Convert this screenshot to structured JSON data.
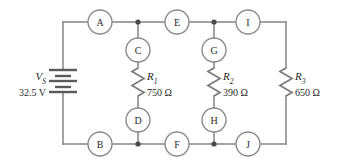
{
  "figure": {
    "type": "schematic-diagram",
    "line_color": "#8c8c8c",
    "text_color": "#1f1f1f"
  },
  "source": {
    "name": "voltage-source",
    "symbol": "V",
    "subscript": "S",
    "value": "32.5 V",
    "symbol_full": "VS"
  },
  "resistors": [
    {
      "symbol": "R",
      "subscript": "1",
      "value": "750 Ω",
      "name": "resistor-r1"
    },
    {
      "symbol": "R",
      "subscript": "2",
      "value": "390 Ω",
      "name": "resistor-r2"
    },
    {
      "symbol": "R",
      "subscript": "3",
      "value": "650 Ω",
      "name": "resistor-r3"
    }
  ],
  "nodes": [
    {
      "label": "A",
      "cx": 100,
      "cy": 22
    },
    {
      "label": "E",
      "cx": 177,
      "cy": 22
    },
    {
      "label": "I",
      "cx": 248,
      "cy": 22
    },
    {
      "label": "C",
      "cx": 138,
      "cy": 50
    },
    {
      "label": "G",
      "cx": 214,
      "cy": 50
    },
    {
      "label": "D",
      "cx": 138,
      "cy": 120
    },
    {
      "label": "H",
      "cx": 214,
      "cy": 120
    },
    {
      "label": "B",
      "cx": 100,
      "cy": 144
    },
    {
      "label": "F",
      "cx": 177,
      "cy": 144
    },
    {
      "label": "J",
      "cx": 248,
      "cy": 144
    }
  ],
  "junctions": [
    {
      "name": "junction-top-r1",
      "cx": 138,
      "cy": 22
    },
    {
      "name": "junction-top-r2",
      "cx": 214,
      "cy": 22
    },
    {
      "name": "junction-bottom-r1",
      "cx": 138,
      "cy": 144
    },
    {
      "name": "junction-bottom-r2",
      "cx": 214,
      "cy": 144
    }
  ]
}
